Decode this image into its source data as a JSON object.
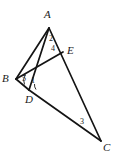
{
  "figure": {
    "kind": "geometry-diagram",
    "width": 114,
    "height": 155,
    "background_color": "#ffffff",
    "stroke_color": "#141414",
    "label_color": "#1a1a1a"
  },
  "points": [
    {
      "id": "A",
      "label": "A",
      "x": 49,
      "y": 28,
      "label_x": 44,
      "label_y": 9
    },
    {
      "id": "B",
      "label": "B",
      "x": 16,
      "y": 79,
      "label_x": 2,
      "label_y": 73
    },
    {
      "id": "C",
      "label": "C",
      "x": 101,
      "y": 141,
      "label_x": 103,
      "label_y": 142
    },
    {
      "id": "D",
      "label": "D",
      "x": 29,
      "y": 90,
      "label_x": 25,
      "label_y": 94
    },
    {
      "id": "E",
      "label": "E",
      "x": 63,
      "y": 52,
      "label_x": 67,
      "label_y": 45
    }
  ],
  "segments": [
    {
      "id": "AB",
      "from": "A",
      "to": "B",
      "x1": 49,
      "y1": 28,
      "x2": 16,
      "y2": 79,
      "width": 1.7
    },
    {
      "id": "AD",
      "from": "A",
      "to": "D",
      "x1": 49,
      "y1": 28,
      "x2": 29,
      "y2": 90,
      "width": 1.7
    },
    {
      "id": "AC",
      "from": "A",
      "to": "C",
      "x1": 49,
      "y1": 28,
      "x2": 101,
      "y2": 141,
      "width": 1.7
    },
    {
      "id": "BE",
      "from": "B",
      "to": "E",
      "x1": 16,
      "y1": 79,
      "x2": 63,
      "y2": 52,
      "width": 1.7
    },
    {
      "id": "BD",
      "from": "B",
      "to": "D",
      "x1": 16,
      "y1": 79,
      "x2": 29,
      "y2": 90,
      "width": 1.7
    },
    {
      "id": "DC",
      "from": "D",
      "to": "C",
      "x1": 29,
      "y1": 90,
      "x2": 101,
      "y2": 141,
      "width": 1.7
    }
  ],
  "angle_labels": [
    {
      "id": "angle-1",
      "text": "1",
      "x": 31,
      "y": 77,
      "at_vertex": "D"
    },
    {
      "id": "angle-2",
      "text": "2",
      "x": 49,
      "y": 35,
      "at_vertex": "A"
    },
    {
      "id": "angle-3",
      "text": "3",
      "x": 80,
      "y": 118,
      "at_vertex": "C"
    },
    {
      "id": "angle-4",
      "text": "4",
      "x": 51,
      "y": 45,
      "at_vertex": "A"
    },
    {
      "id": "angle-5",
      "text": "5",
      "x": 22,
      "y": 75,
      "at_vertex": "B"
    }
  ],
  "angle_arcs": [
    {
      "id": "arc-at-B",
      "path": "M 25.5 74.5 A 10 10 0 0 0 24.5 84.5"
    },
    {
      "id": "arc-at-D",
      "path": "M 34.5 84.0 A 8 8 0 0 0 36.0 89.5"
    }
  ]
}
